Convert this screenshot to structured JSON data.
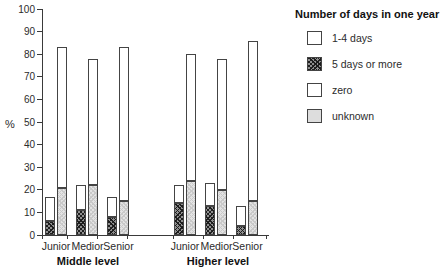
{
  "chart": {
    "ylabel": "%",
    "legend": {
      "title": "Number of days in one year",
      "items": [
        {
          "label": "1-4 days",
          "swatch": "white"
        },
        {
          "label": "5 days or more",
          "swatch": "dark-crosshatch"
        },
        {
          "label": "zero",
          "swatch": "white"
        },
        {
          "label": "unknown",
          "swatch": "light-gray"
        }
      ]
    },
    "levels": [
      {
        "label": "Middle level",
        "categories": [
          "Junior",
          "Medior",
          "Senior"
        ]
      },
      {
        "label": "Higher level",
        "categories": [
          "Junior",
          "Medior",
          "Senior"
        ]
      }
    ],
    "colors": {
      "outline": "#444444",
      "dark_hatch": "#6e6e6e",
      "light_gray": "#dddddd",
      "white": "#ffffff",
      "text": "#222222"
    }
  },
  "chart_data": {
    "type": "bar",
    "stacked": true,
    "title": "",
    "xlabel": "",
    "ylabel": "%",
    "ylim": [
      0,
      100
    ],
    "yticks": [
      0,
      10,
      20,
      30,
      40,
      50,
      60,
      70,
      80,
      90,
      100
    ],
    "grid": false,
    "legend_position": "top-right",
    "legend_title": "Number of days in one year",
    "legend_entries": [
      "1-4 days",
      "5 days or more",
      "zero",
      "unknown"
    ],
    "column_structure": {
      "column1_bottom_to_top": [
        "5 days or more",
        "1-4 days"
      ],
      "column2_bottom_to_top": [
        "unknown",
        "zero"
      ]
    },
    "groups": [
      {
        "level": "Middle level",
        "category": "Junior",
        "values": {
          "5 days or more": 6,
          "1-4 days": 11,
          "unknown": 21,
          "zero": 62
        },
        "col1_top": 17,
        "col2_top": 83
      },
      {
        "level": "Middle level",
        "category": "Medior",
        "values": {
          "5 days or more": 11,
          "1-4 days": 11,
          "unknown": 22,
          "zero": 56
        },
        "col1_top": 22,
        "col2_top": 78
      },
      {
        "level": "Middle level",
        "category": "Senior",
        "values": {
          "5 days or more": 8,
          "1-4 days": 9,
          "unknown": 15,
          "zero": 68
        },
        "col1_top": 17,
        "col2_top": 83
      },
      {
        "level": "Higher level",
        "category": "Junior",
        "values": {
          "5 days or more": 14,
          "1-4 days": 8,
          "unknown": 24,
          "zero": 56
        },
        "col1_top": 22,
        "col2_top": 80
      },
      {
        "level": "Higher level",
        "category": "Medior",
        "values": {
          "5 days or more": 13,
          "1-4 days": 10,
          "unknown": 20,
          "zero": 58
        },
        "col1_top": 23,
        "col2_top": 78
      },
      {
        "level": "Higher level",
        "category": "Senior",
        "values": {
          "5 days or more": 4,
          "1-4 days": 9,
          "unknown": 15,
          "zero": 71
        },
        "col1_top": 13,
        "col2_top": 86
      }
    ]
  }
}
